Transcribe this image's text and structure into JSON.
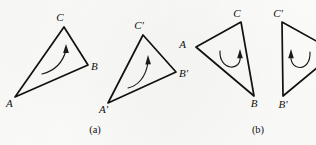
{
  "figure": {
    "background_color": "#fbfbfa",
    "ink_color": "#111111",
    "panels": [
      {
        "caption": "(a)",
        "caption_x": 95,
        "caption_y": 131,
        "description": "translation: triangle ABC maps to congruent triangle A'B'C' with same orientation",
        "rotation_sense": "counterclockwise-sweep-arrow",
        "triangles": [
          {
            "name": "triangle-abc",
            "vertices": [
              {
                "label": "A",
                "x": 15,
                "y": 97,
                "label_x": 7,
                "label_y": 105
              },
              {
                "label": "B",
                "x": 88,
                "y": 65,
                "label_x": 92,
                "label_y": 70
              },
              {
                "label": "C",
                "x": 64,
                "y": 27,
                "label_x": 60,
                "label_y": 20
              }
            ],
            "arrow": {
              "kind": "curved-sweep",
              "path": "M 42,74 C 50,72 62,66 66,50",
              "head_x": 66,
              "head_y": 46,
              "head_angle": -76
            }
          },
          {
            "name": "triangle-a-prime-b-prime-c-prime",
            "vertices": [
              {
                "label": "A'",
                "x": 108,
                "y": 103,
                "label_x": 100,
                "label_y": 111
              },
              {
                "label": "B'",
                "x": 176,
                "y": 72,
                "label_x": 180,
                "label_y": 77
              },
              {
                "label": "C'",
                "x": 143,
                "y": 35,
                "label_x": 138,
                "label_y": 27
              },
              {
                "label": "__shape_note",
                "x": 0,
                "y": 0,
                "label_x": 0,
                "label_y": 0
              }
            ],
            "arrow": {
              "kind": "curved-sweep",
              "path": "M 128,88 C 136,86 146,78 148,62",
              "head_x": 148,
              "head_y": 58,
              "head_angle": -80
            }
          }
        ]
      },
      {
        "caption": "(b)",
        "caption_x": 258,
        "caption_y": 131,
        "description": "rotation: triangle ABC maps to triangle A'B'C' with reversed sweep direction",
        "rotation_sense": "u-turn-loop-arrow",
        "triangles": [
          {
            "name": "triangle-abc",
            "vertices": [
              {
                "label": "A",
                "x": 196,
                "y": 47,
                "label_x": 187,
                "label_y": 45
              },
              {
                "label": "B",
                "x": 254,
                "y": 96,
                "label_x": 254,
                "label_y": 105
              },
              {
                "label": "C",
                "x": 241,
                "y": 22,
                "label_x": 236,
                "label_y": 16
              }
            ],
            "arrow": {
              "kind": "u-loop",
              "path": "M 220,51 C 219,70 242,72 240,55",
              "head_x": 240,
              "head_y": 51,
              "head_angle": -84
            }
          },
          {
            "name": "triangle-a-prime-b-prime-c-prime",
            "vertices": [
              {
                "label": "C'",
                "x": 282,
                "y": 22,
                "label_x": 277,
                "label_y": 15
              },
              {
                "label": "B'",
                "x": 283,
                "y": 96,
                "label_x": 279,
                "label_y": 106
              },
              {
                "label": "A'",
                "x": 336,
                "y": 52,
                "label_x": 330,
                "label_y": 50
              }
            ],
            "arrow": {
              "kind": "u-loop-mirrored",
              "path": "M 310,52 C 311,72 290,72 291,55",
              "head_x": 291,
              "head_y": 51,
              "head_angle": -84
            }
          }
        ]
      }
    ]
  }
}
